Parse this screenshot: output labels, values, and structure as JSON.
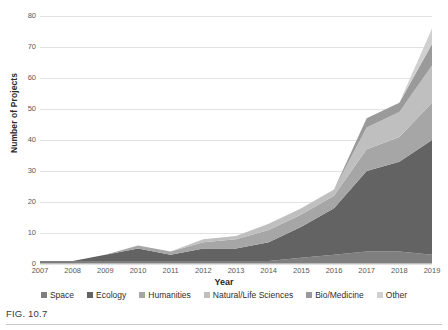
{
  "figure": {
    "caption": "FIG. 10.7"
  },
  "chart_data": {
    "type": "area",
    "stacked": true,
    "title": "",
    "xlabel": "Year",
    "ylabel": "Number of Projects",
    "categories": [
      "2007",
      "2008",
      "2009",
      "2010",
      "2011",
      "2012",
      "2013",
      "2014",
      "2015",
      "2016",
      "2017",
      "2018",
      "2019"
    ],
    "x": [
      2007,
      2008,
      2009,
      2010,
      2011,
      2012,
      2013,
      2014,
      2015,
      2016,
      2017,
      2018,
      2019
    ],
    "ylim": [
      0,
      80
    ],
    "yticks": [
      0,
      10,
      20,
      30,
      40,
      50,
      60,
      70,
      80
    ],
    "grid": true,
    "legend_position": "bottom",
    "series": [
      {
        "name": "Space",
        "color": "#7f7f7f",
        "values": [
          1,
          1,
          1,
          1,
          1,
          1,
          1,
          1,
          2,
          3,
          4,
          4,
          3
        ]
      },
      {
        "name": "Ecology",
        "color": "#636363",
        "values": [
          0,
          0,
          2,
          4,
          2,
          4,
          4,
          6,
          10,
          15,
          26,
          29,
          37
        ]
      },
      {
        "name": "Humanities",
        "color": "#a6a6a6",
        "values": [
          0,
          0,
          0,
          1,
          1,
          2,
          3,
          4,
          4,
          4,
          7,
          8,
          12
        ]
      },
      {
        "name": "Natural/Life Sciences",
        "color": "#bfbfbf",
        "values": [
          0,
          0,
          0,
          0,
          0,
          1,
          1,
          2,
          2,
          2,
          7,
          8,
          12
        ]
      },
      {
        "name": "Bio/Medicine",
        "color": "#9a9a9a",
        "values": [
          0,
          0,
          0,
          0,
          0,
          0,
          0,
          0,
          0,
          0,
          3,
          3,
          7
        ]
      },
      {
        "name": "Other",
        "color": "#d0d0d0",
        "values": [
          0,
          0,
          0,
          0,
          0,
          0,
          0,
          0,
          0,
          0,
          0,
          0,
          5
        ]
      }
    ],
    "totals": [
      1,
      1,
      3,
      6,
      4,
      8,
      9,
      13,
      18,
      24,
      47,
      52,
      76
    ]
  }
}
